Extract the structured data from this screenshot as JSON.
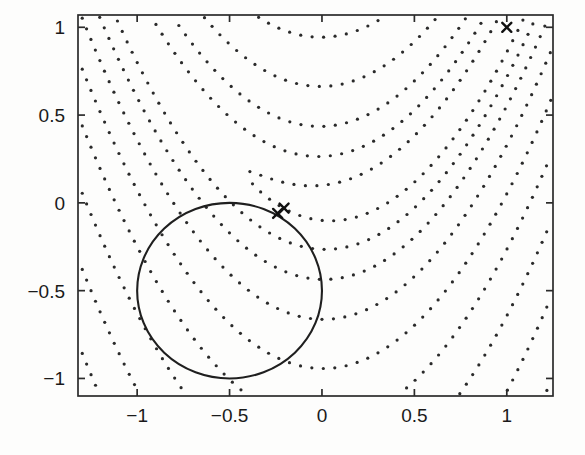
{
  "figure": {
    "width": 585,
    "height": 455,
    "background_color": "#fdfdfc"
  },
  "chart_data": {
    "type": "line",
    "title": "",
    "xlabel": "",
    "ylabel": "",
    "xlim": [
      -1.32,
      1.25
    ],
    "ylim": [
      -1.1,
      1.07
    ],
    "xticks": [
      -1,
      -0.5,
      0,
      0.5,
      1
    ],
    "xtick_labels": [
      "−1",
      "−0.5",
      "0",
      "0.5",
      "1"
    ],
    "yticks": [
      -1,
      -0.5,
      0,
      0.5,
      1
    ],
    "ytick_labels": [
      "−1",
      "−0.5",
      "0",
      "0.5",
      "1"
    ],
    "grid": false,
    "legend": "none",
    "box": true,
    "contour": {
      "style": "dotted",
      "color": "#2a2a2a",
      "dot_radius": 1.6,
      "function": "rosenbrock",
      "formula": "(1-x)^2 + 100*(y - x^2)^2",
      "levels": [
        2,
        8,
        20,
        45,
        90,
        160,
        270,
        430,
        650,
        950,
        1350,
        1900,
        2600,
        3500
      ],
      "description": "Dotted parabolic contour curves of the Rosenbrock banana function opening upward with vertices near x = 0"
    },
    "constraint": {
      "style": "solid",
      "color": "#1f1f1f",
      "shape": "circle",
      "center": [
        -0.5,
        -0.5
      ],
      "radius": 0.5,
      "formula": "(x + 0.5)^2 + (y + 0.5)^2 = 0.25",
      "description": "Solid circular constraint boundary"
    },
    "markers": {
      "symbol": "x",
      "color": "#111111",
      "size": 9,
      "points": [
        {
          "x": 1.0,
          "y": 1.0,
          "role": "start-point"
        },
        {
          "x": -0.24,
          "y": -0.06,
          "role": "iterate"
        },
        {
          "x": -0.205,
          "y": -0.03,
          "role": "solution"
        }
      ]
    }
  }
}
